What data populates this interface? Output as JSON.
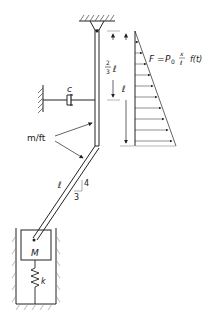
{
  "diagram": {
    "labels": {
      "force_eq_F": "F",
      "force_eq_eq": "=",
      "force_eq_P": "P",
      "force_eq_sub": "0",
      "force_eq_x": "x",
      "force_eq_l": "ℓ",
      "force_eq_ft": "f(t)",
      "damper": "c",
      "two_thirds_num": "2",
      "two_thirds_den": "3",
      "two_thirds_l": "ℓ",
      "full_length": "ℓ",
      "mass_per_length": "m/ft",
      "lower_rod_length": "ℓ",
      "slope_rise": "4",
      "slope_run": "3",
      "mass": "M",
      "spring": "k"
    },
    "colors": {
      "line": "#222222",
      "hatch": "#555555"
    }
  }
}
